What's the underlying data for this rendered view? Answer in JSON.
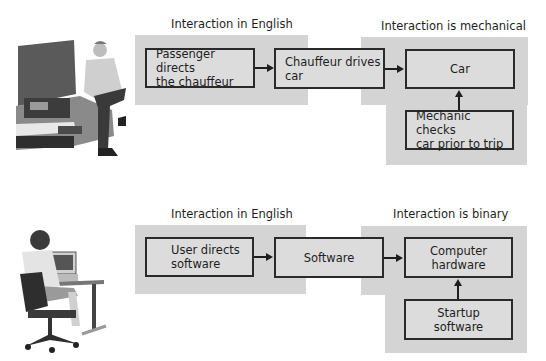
{
  "diagrams": [
    {
      "name": "car-analogy",
      "labels": {
        "left_region": "Interaction in English",
        "right_region": "Interaction is mechanical"
      },
      "boxes": [
        {
          "id": "passenger",
          "text": "Passenger directs\nthe chauffeur"
        },
        {
          "id": "chauffeur",
          "text": "Chauffeur drives\ncar"
        },
        {
          "id": "car",
          "text": "Car"
        },
        {
          "id": "mechanic",
          "text": "Mechanic checks\ncar prior to trip"
        }
      ],
      "illustration": "man-sitting-on-car-illustration"
    },
    {
      "name": "computer-analogy",
      "labels": {
        "left_region": "Interaction in English",
        "right_region": "Interaction is binary"
      },
      "boxes": [
        {
          "id": "user",
          "text": "User directs\nsoftware"
        },
        {
          "id": "software",
          "text": "Software"
        },
        {
          "id": "hardware",
          "text": "Computer\nhardware"
        },
        {
          "id": "startup",
          "text": "Startup\nsoftware"
        }
      ],
      "illustration": "woman-at-computer-illustration"
    }
  ],
  "colors": {
    "region_bg": "#d4d4d4",
    "box_bg": "#dcdcdc",
    "border": "#2a2a2a"
  }
}
